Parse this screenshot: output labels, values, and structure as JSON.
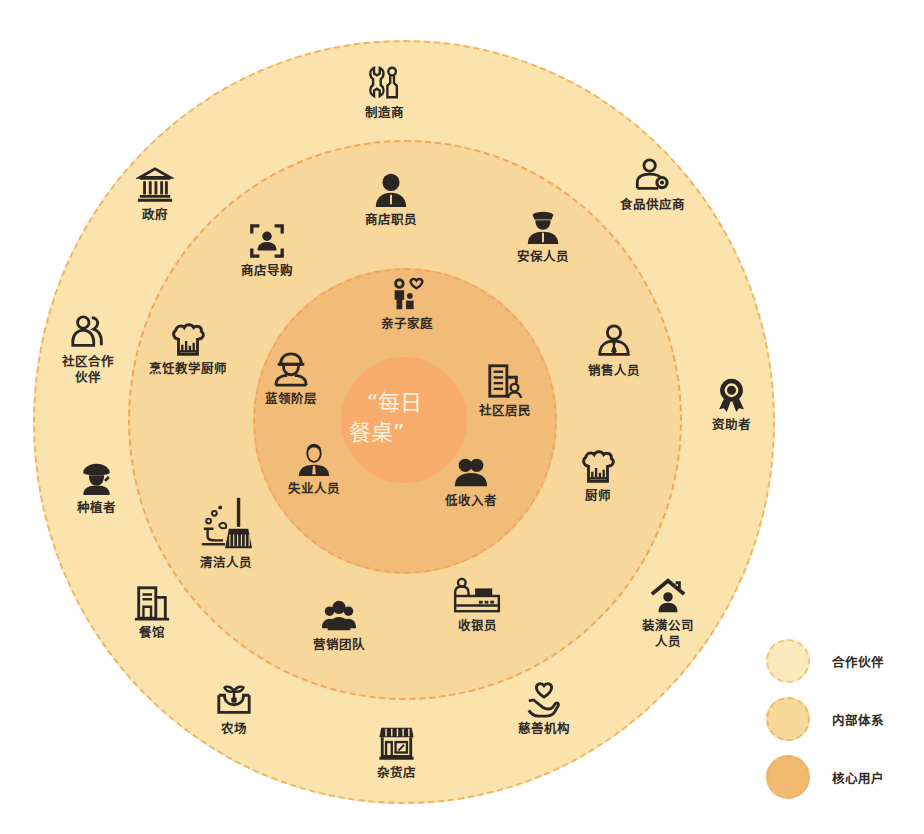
{
  "center": {
    "line1": "“每日",
    "line2": "餐桌”"
  },
  "colors": {
    "partner_ring": "#fae3ac",
    "internal_ring": "#f7d79a",
    "core_ring": "#f1bc78",
    "center_circle": "#f8ac6c",
    "dash": "#f1a75c",
    "icon": "#2b2622"
  },
  "rings": {
    "core_users": [
      {
        "label": "亲子家庭",
        "icon": "family-heart-icon"
      },
      {
        "label": "社区居民",
        "icon": "building-resident-icon"
      },
      {
        "label": "低收入者",
        "icon": "people-group-icon"
      },
      {
        "label": "失业人员",
        "icon": "person-suit-icon"
      },
      {
        "label": "蓝领阶层",
        "icon": "worker-hardhat-icon"
      }
    ],
    "internal_system": [
      {
        "label": "商店职员",
        "icon": "staff-person-icon"
      },
      {
        "label": "安保人员",
        "icon": "security-guard-icon"
      },
      {
        "label": "销售人员",
        "icon": "salesperson-icon"
      },
      {
        "label": "厨师",
        "icon": "chef-hat-icon"
      },
      {
        "label": "收银员",
        "icon": "cashier-icon"
      },
      {
        "label": "营销团队",
        "icon": "team-icon"
      },
      {
        "label": "清洁人员",
        "icon": "broom-icon"
      },
      {
        "label": "烹饪教学厨师",
        "icon": "chef-hat-icon"
      },
      {
        "label": "商店导购",
        "icon": "focus-person-icon"
      }
    ],
    "partners": [
      {
        "label": "制造商",
        "icon": "tools-icon"
      },
      {
        "label": "食品供应商",
        "icon": "supplier-icon"
      },
      {
        "label": "资助者",
        "icon": "award-ribbon-icon"
      },
      {
        "label": "装潢公司\n人员",
        "icon": "house-person-icon"
      },
      {
        "label": "慈善机构",
        "icon": "hand-heart-icon"
      },
      {
        "label": "杂货店",
        "icon": "storefront-icon"
      },
      {
        "label": "农场",
        "icon": "farm-sprout-icon"
      },
      {
        "label": "餐馆",
        "icon": "restaurant-building-icon"
      },
      {
        "label": "种植者",
        "icon": "farmer-icon"
      },
      {
        "label": "社区合作\n伙伴",
        "icon": "community-partners-icon"
      },
      {
        "label": "政府",
        "icon": "government-building-icon"
      }
    ]
  },
  "legend": [
    {
      "label": "合作伙伴",
      "key": "partners"
    },
    {
      "label": "内部体系",
      "key": "internal"
    },
    {
      "label": "核心用户",
      "key": "core"
    }
  ]
}
